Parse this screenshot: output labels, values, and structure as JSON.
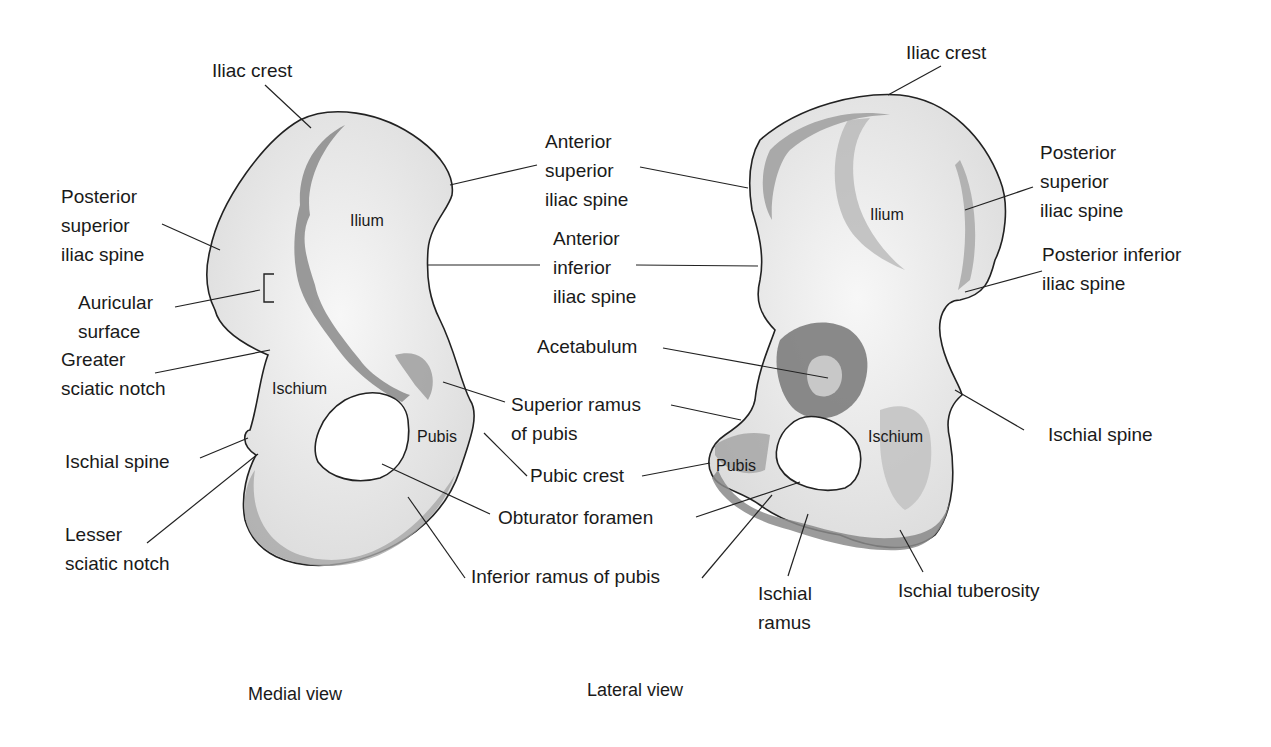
{
  "colors": {
    "bone_light": "#ededed",
    "bone_mid": "#c9c9c9",
    "bone_dark": "#8a8a8a",
    "outline": "#222222",
    "leader": "#222222"
  },
  "medial": {
    "caption": "Medial view",
    "regions": {
      "ilium": "Ilium",
      "ischium": "Ischium",
      "pubis": "Pubis"
    },
    "labels": {
      "iliac_crest": "Iliac crest",
      "posterior_superior_iliac_spine": "Posterior\nsuperior\niliac spine",
      "auricular_surface": "Auricular\nsurface",
      "greater_sciatic_notch": "Greater\nsciatic notch",
      "ischial_spine": "Ischial spine",
      "lesser_sciatic_notch": "Lesser\nsciatic notch"
    }
  },
  "center_labels": {
    "anterior_superior_iliac_spine": "Anterior\nsuperior\niliac spine",
    "anterior_inferior_iliac_spine": "Anterior\ninferior\niliac spine",
    "acetabulum": "Acetabulum",
    "superior_ramus_of_pubis": "Superior ramus\nof pubis",
    "pubic_crest": "Pubic crest",
    "obturator_foramen": "Obturator foramen",
    "inferior_ramus_of_pubis": "Inferior ramus of pubis"
  },
  "lateral": {
    "caption": "Lateral view",
    "regions": {
      "ilium": "Ilium",
      "ischium": "Ischium",
      "pubis": "Pubis"
    },
    "labels": {
      "iliac_crest": "Iliac crest",
      "posterior_superior_iliac_spine": "Posterior\nsuperior\niliac spine",
      "posterior_inferior_iliac_spine": "Posterior inferior\niliac spine",
      "ischial_spine": "Ischial spine",
      "ischial_ramus": "Ischial\nramus",
      "ischial_tuberosity": "Ischial tuberosity"
    }
  }
}
